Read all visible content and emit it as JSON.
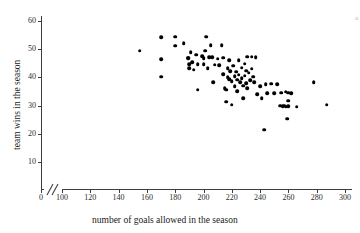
{
  "chart_data": {
    "type": "scatter",
    "title": "",
    "xlabel": "number of goals allowed in the season",
    "ylabel": "team wins in the season",
    "xlim": [
      90,
      310
    ],
    "ylim": [
      4,
      63
    ],
    "xticks": [
      0,
      100,
      120,
      140,
      160,
      180,
      200,
      220,
      240,
      260,
      280,
      300
    ],
    "yticks": [
      10,
      20,
      30,
      40,
      50,
      60
    ],
    "grid": false,
    "legend": null,
    "axis_break": "//",
    "axis_break_note": "x-axis broken between 0 and 100",
    "marker_color": "#000000",
    "n_points": 92,
    "points": [
      [
        155,
        49.4
      ],
      [
        170,
        54.3
      ],
      [
        170,
        46.4
      ],
      [
        170,
        40.3
      ],
      [
        180,
        54.4
      ],
      [
        180,
        51.2
      ],
      [
        186,
        52.2
      ],
      [
        189,
        47.0
      ],
      [
        189,
        46.8
      ],
      [
        190,
        44.7
      ],
      [
        190,
        43.3
      ],
      [
        191,
        49.0
      ],
      [
        192,
        45.4
      ],
      [
        193,
        42.8
      ],
      [
        195,
        48.0
      ],
      [
        196,
        44.6
      ],
      [
        196,
        35.6
      ],
      [
        199,
        47.5
      ],
      [
        200,
        46.8
      ],
      [
        200,
        44.6
      ],
      [
        201,
        49.5
      ],
      [
        202,
        54.4
      ],
      [
        203,
        43.3
      ],
      [
        204,
        47.1
      ],
      [
        205,
        51.4
      ],
      [
        206,
        47.1
      ],
      [
        207,
        38.4
      ],
      [
        208,
        44.5
      ],
      [
        210,
        46.6
      ],
      [
        211,
        44.3
      ],
      [
        213,
        51.5
      ],
      [
        214,
        47.0
      ],
      [
        214,
        41.2
      ],
      [
        215,
        36.2
      ],
      [
        216,
        35.6
      ],
      [
        216,
        31.4
      ],
      [
        217,
        43.3
      ],
      [
        217,
        40.0
      ],
      [
        218,
        46.0
      ],
      [
        218,
        39.4
      ],
      [
        219,
        42.2
      ],
      [
        220,
        38.6
      ],
      [
        220,
        30.3
      ],
      [
        221,
        44.2
      ],
      [
        222,
        40.4
      ],
      [
        222,
        36.8
      ],
      [
        223,
        42.0
      ],
      [
        224,
        39.2
      ],
      [
        224,
        35.1
      ],
      [
        225,
        46.2
      ],
      [
        225,
        41.0
      ],
      [
        226,
        38.2
      ],
      [
        227,
        43.4
      ],
      [
        227,
        39.8
      ],
      [
        228,
        37.0
      ],
      [
        228,
        32.6
      ],
      [
        229,
        44.8
      ],
      [
        229,
        40.6
      ],
      [
        230,
        42.4
      ],
      [
        230,
        38.0
      ],
      [
        231,
        47.4
      ],
      [
        231,
        36.2
      ],
      [
        232,
        41.6
      ],
      [
        233,
        39.0
      ],
      [
        234,
        47.3
      ],
      [
        234,
        43.1
      ],
      [
        235,
        40.2
      ],
      [
        236,
        38.2
      ],
      [
        237,
        47.2
      ],
      [
        238,
        34.0
      ],
      [
        240,
        36.8
      ],
      [
        241,
        32.6
      ],
      [
        243,
        21.4
      ],
      [
        244,
        37.6
      ],
      [
        245,
        34.4
      ],
      [
        248,
        37.8
      ],
      [
        250,
        34.4
      ],
      [
        252,
        37.6
      ],
      [
        254,
        30.0
      ],
      [
        255,
        34.6
      ],
      [
        256,
        29.7
      ],
      [
        257,
        30.0
      ],
      [
        258,
        35.0
      ],
      [
        258,
        29.6
      ],
      [
        259,
        25.4
      ],
      [
        260,
        34.6
      ],
      [
        260,
        31.8
      ],
      [
        260,
        29.8
      ],
      [
        262,
        34.5
      ],
      [
        266,
        29.6
      ],
      [
        278,
        38.4
      ],
      [
        287,
        30.3
      ]
    ]
  },
  "axes": {
    "x_tick_labels": [
      "0",
      "100",
      "120",
      "140",
      "160",
      "180",
      "200",
      "220",
      "240",
      "260",
      "280",
      "300"
    ],
    "y_tick_labels": [
      "10",
      "20",
      "30",
      "40",
      "50",
      "60"
    ],
    "x_title": "number of goals allowed in the season",
    "y_title": "team wins in the season"
  },
  "artifact": {
    "corner_mark": "a"
  }
}
